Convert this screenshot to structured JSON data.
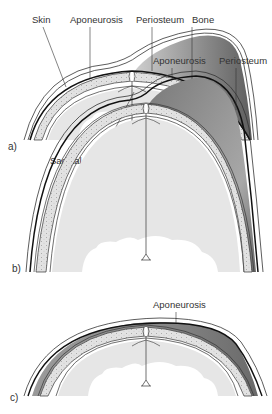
{
  "figure": {
    "colors": {
      "hematoma_dark": "#6f6f6f",
      "hematoma_light": "#c9c9c9",
      "bone": "#dcdcdc",
      "brain": "#e6e6e6",
      "line": "#222222"
    },
    "panels": [
      {
        "id": "a",
        "panel_label": "a)",
        "labels": {
          "skin": "Skin",
          "aponeurosis": "Aponeurosis",
          "periosteum": "Periosteum",
          "bone": "Bone",
          "sagittal_suture": "Sagittal suture"
        }
      },
      {
        "id": "b",
        "panel_label": "b)",
        "labels": {
          "aponeurosis": "Aponeurosis",
          "periosteum": "Periosteum"
        }
      },
      {
        "id": "c",
        "panel_label": "c)",
        "labels": {
          "aponeurosis": "Aponeurosis"
        }
      }
    ]
  }
}
